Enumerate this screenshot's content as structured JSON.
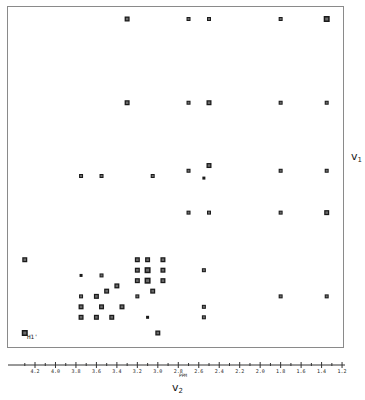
{
  "chart_data": {
    "type": "heatmap",
    "subtype": "2D NMR correlation spectrum (contour plot)",
    "title": "",
    "xlabel": "v2",
    "xlabel_main": "v",
    "xlabel_sub": "2",
    "ylabel": "v1",
    "ylabel_main": "v",
    "ylabel_sub": "1",
    "x_unit": "PPM",
    "x_ticks": [
      "4.2",
      "4.0",
      "3.8",
      "3.6",
      "3.4",
      "3.2",
      "3.0",
      "2.8",
      "2.6",
      "2.4",
      "2.2",
      "2.0",
      "1.8",
      "1.6",
      "1.4",
      "1.2"
    ],
    "xlim": [
      4.4,
      1.2
    ],
    "ylim": [
      4.4,
      1.2
    ],
    "grid": false,
    "legend": null,
    "annotations": [
      {
        "text": "H1'",
        "ppm_x": 4.3,
        "ppm_y": 4.3
      }
    ],
    "peaks": [
      {
        "x": 3.3,
        "y": 1.3,
        "size": 5
      },
      {
        "x": 2.7,
        "y": 1.3,
        "size": 4
      },
      {
        "x": 2.5,
        "y": 1.3,
        "size": 4
      },
      {
        "x": 1.8,
        "y": 1.3,
        "size": 4
      },
      {
        "x": 1.35,
        "y": 1.3,
        "size": 6
      },
      {
        "x": 3.3,
        "y": 2.1,
        "size": 5
      },
      {
        "x": 2.7,
        "y": 2.1,
        "size": 4
      },
      {
        "x": 2.5,
        "y": 2.1,
        "size": 5
      },
      {
        "x": 1.8,
        "y": 2.1,
        "size": 4
      },
      {
        "x": 1.35,
        "y": 2.1,
        "size": 4
      },
      {
        "x": 3.75,
        "y": 2.8,
        "size": 4
      },
      {
        "x": 3.55,
        "y": 2.8,
        "size": 4
      },
      {
        "x": 3.05,
        "y": 2.8,
        "size": 4
      },
      {
        "x": 2.7,
        "y": 2.75,
        "size": 4
      },
      {
        "x": 2.5,
        "y": 2.7,
        "size": 5
      },
      {
        "x": 2.55,
        "y": 2.82,
        "size": 3
      },
      {
        "x": 1.8,
        "y": 2.75,
        "size": 4
      },
      {
        "x": 1.35,
        "y": 2.75,
        "size": 4
      },
      {
        "x": 2.7,
        "y": 3.15,
        "size": 4
      },
      {
        "x": 2.5,
        "y": 3.15,
        "size": 4
      },
      {
        "x": 1.8,
        "y": 3.15,
        "size": 4
      },
      {
        "x": 1.35,
        "y": 3.15,
        "size": 5
      },
      {
        "x": 4.3,
        "y": 3.6,
        "size": 5
      },
      {
        "x": 3.2,
        "y": 3.6,
        "size": 5
      },
      {
        "x": 3.1,
        "y": 3.6,
        "size": 5
      },
      {
        "x": 2.95,
        "y": 3.6,
        "size": 5
      },
      {
        "x": 3.2,
        "y": 3.7,
        "size": 5
      },
      {
        "x": 3.1,
        "y": 3.7,
        "size": 6
      },
      {
        "x": 2.95,
        "y": 3.7,
        "size": 5
      },
      {
        "x": 3.75,
        "y": 3.75,
        "size": 3
      },
      {
        "x": 3.55,
        "y": 3.75,
        "size": 4
      },
      {
        "x": 3.2,
        "y": 3.8,
        "size": 5
      },
      {
        "x": 3.1,
        "y": 3.8,
        "size": 6
      },
      {
        "x": 2.95,
        "y": 3.8,
        "size": 5
      },
      {
        "x": 2.55,
        "y": 3.7,
        "size": 4
      },
      {
        "x": 3.75,
        "y": 3.95,
        "size": 4
      },
      {
        "x": 3.6,
        "y": 3.95,
        "size": 5
      },
      {
        "x": 3.5,
        "y": 3.9,
        "size": 5
      },
      {
        "x": 3.4,
        "y": 3.85,
        "size": 5
      },
      {
        "x": 3.2,
        "y": 3.95,
        "size": 4
      },
      {
        "x": 3.05,
        "y": 3.9,
        "size": 5
      },
      {
        "x": 1.8,
        "y": 3.95,
        "size": 4
      },
      {
        "x": 1.35,
        "y": 3.95,
        "size": 4
      },
      {
        "x": 3.75,
        "y": 4.05,
        "size": 5
      },
      {
        "x": 3.55,
        "y": 4.05,
        "size": 5
      },
      {
        "x": 3.35,
        "y": 4.05,
        "size": 5
      },
      {
        "x": 2.55,
        "y": 4.05,
        "size": 4
      },
      {
        "x": 3.75,
        "y": 4.15,
        "size": 5
      },
      {
        "x": 3.6,
        "y": 4.15,
        "size": 5
      },
      {
        "x": 3.45,
        "y": 4.15,
        "size": 5
      },
      {
        "x": 3.1,
        "y": 4.15,
        "size": 3
      },
      {
        "x": 2.55,
        "y": 4.15,
        "size": 4
      },
      {
        "x": 4.3,
        "y": 4.3,
        "size": 6
      },
      {
        "x": 3.0,
        "y": 4.3,
        "size": 5
      }
    ]
  }
}
